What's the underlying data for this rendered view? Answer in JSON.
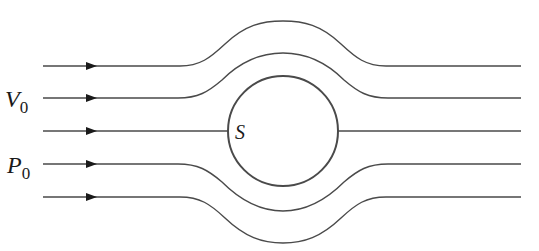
{
  "diagram": {
    "labels": {
      "velocity_main": "V",
      "velocity_sub": "0",
      "pressure_main": "P",
      "pressure_sub": "0",
      "stagnation_point": "S"
    },
    "streamlines": [
      {
        "id": "streamline-1",
        "y": 66,
        "deflection": "up",
        "peak_y": 21
      },
      {
        "id": "streamline-2",
        "y": 98,
        "deflection": "up",
        "peak_y": 53
      },
      {
        "id": "streamline-3",
        "y": 131,
        "deflection": "none",
        "note": "stagnation streamline"
      },
      {
        "id": "streamline-4",
        "y": 164,
        "deflection": "down",
        "trough_y": 211
      },
      {
        "id": "streamline-5",
        "y": 197,
        "deflection": "down",
        "trough_y": 243
      }
    ],
    "sphere": {
      "cx": 283,
      "cy": 131,
      "r": 55
    },
    "colors": {
      "line": "#4a4a4a",
      "arrow": "#1a1a1a",
      "background": "#ffffff"
    }
  }
}
